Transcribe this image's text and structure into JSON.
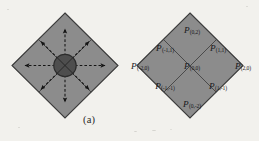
{
  "figure": {
    "background_color": "#f2f1ed",
    "panels": [
      {
        "id": "a",
        "caption": "(a)",
        "description": "diamond lattice with radiating arrows from center",
        "fill_color": "#8c8c8c",
        "edge_color": "#3b3b3b",
        "center_marker_color": "#4a4a4a",
        "arrow_color": "#1a1a1a",
        "arrow_style": "dashed",
        "arrow_count": 8,
        "arrow_directions": [
          "up",
          "down",
          "left",
          "right",
          "up-left",
          "up-right",
          "down-left",
          "down-right"
        ]
      },
      {
        "id": "b",
        "caption": "(b)",
        "description": "diamond lattice with indexed cell labels",
        "fill_color": "#8c8c8c",
        "edge_color": "#3b3b3b",
        "label_color": "#17171a",
        "cells": [
          {
            "name": "cell-0-2",
            "symbol": "P",
            "index": "(0,2)",
            "grid": [
              0,
              2
            ]
          },
          {
            "name": "cell-n1-1",
            "symbol": "P",
            "index": "(-1,1)",
            "grid": [
              -1,
              1
            ]
          },
          {
            "name": "cell-1-1",
            "symbol": "P",
            "index": "(1,1)",
            "grid": [
              1,
              1
            ]
          },
          {
            "name": "cell-n2-0",
            "symbol": "P",
            "index": "(-2,0)",
            "grid": [
              -2,
              0
            ]
          },
          {
            "name": "cell-0-0",
            "symbol": "P",
            "index": "(0,0)",
            "grid": [
              0,
              0
            ]
          },
          {
            "name": "cell-2-0",
            "symbol": "P",
            "index": "(2,0)",
            "grid": [
              2,
              0
            ]
          },
          {
            "name": "cell-n1-n1",
            "symbol": "P",
            "index": "(-1,-1)",
            "grid": [
              -1,
              -1
            ]
          },
          {
            "name": "cell-1-n1",
            "symbol": "P",
            "index": "(1,-1)",
            "grid": [
              1,
              -1
            ]
          },
          {
            "name": "cell-0-n2",
            "symbol": "P",
            "index": "(0,-2)",
            "grid": [
              0,
              -2
            ]
          }
        ]
      }
    ]
  }
}
